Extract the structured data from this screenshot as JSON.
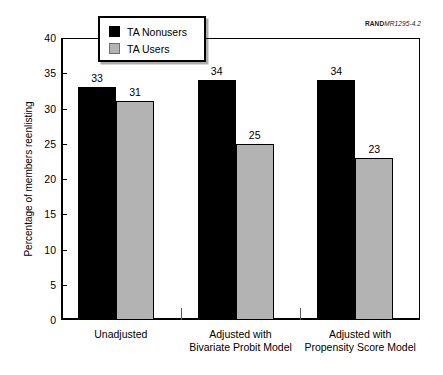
{
  "source_credit": {
    "prefix": "RAND",
    "suffix": "MR1295-4.2"
  },
  "chart_data": {
    "type": "bar",
    "title": "",
    "subtitle": "",
    "xlabel": "",
    "ylabel": "Percentage of members reenlisting",
    "ylim": [
      0,
      40
    ],
    "ytick_step": 5,
    "ytick_labels": [
      "0",
      "5",
      "10",
      "15",
      "20",
      "25",
      "30",
      "35",
      "40"
    ],
    "grid": false,
    "legend_position": "top-center",
    "categories": [
      "Unadjusted",
      "Adjusted with\nBivariate Probit Model",
      "Adjusted with\nPropensity Score Model"
    ],
    "series": [
      {
        "name": "TA Nonusers",
        "color": "#000000",
        "values": [
          33,
          34,
          34
        ],
        "labels": [
          "33",
          "34",
          "34"
        ]
      },
      {
        "name": "TA Users",
        "color": "#b3b3b3",
        "values": [
          31,
          25,
          23
        ],
        "labels": [
          "31",
          "25",
          "23"
        ]
      }
    ]
  }
}
